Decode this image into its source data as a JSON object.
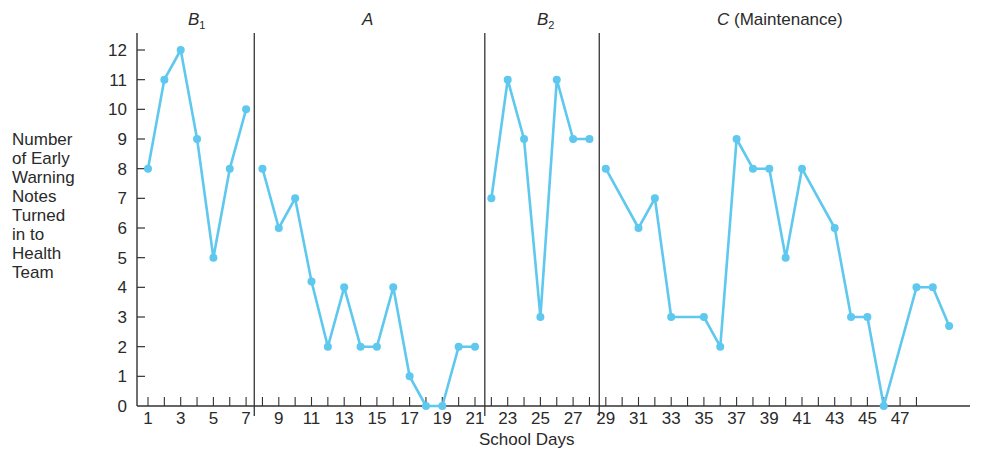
{
  "chart_data": {
    "type": "line",
    "title": "",
    "xlabel": "School Days",
    "ylabel": "Number of Early Warning Notes Turned in to Health Team",
    "ylabel_lines": [
      "Number",
      "of Early",
      "Warning",
      "Notes",
      "Turned",
      "in to",
      "Health",
      "Team"
    ],
    "ylim": [
      0,
      12
    ],
    "yticks": [
      0,
      1,
      2,
      3,
      4,
      5,
      6,
      7,
      8,
      9,
      10,
      11,
      12
    ],
    "xtick_labels": [
      1,
      3,
      5,
      7,
      9,
      11,
      13,
      15,
      17,
      19,
      21,
      23,
      25,
      27,
      29,
      31,
      33,
      35,
      37,
      39,
      41,
      43,
      45,
      47
    ],
    "x_minor_ticks_to": 48,
    "grid": false,
    "line_color": "#5ec8ee",
    "axis_color": "#333333",
    "phases": [
      {
        "name": "B",
        "sub": "1",
        "suffix": "",
        "start_day": 1,
        "end_day": 7,
        "x": [
          1,
          2,
          3,
          4,
          5,
          6,
          7
        ],
        "values": [
          8,
          11,
          12,
          9,
          5,
          8,
          10
        ]
      },
      {
        "name": "A",
        "sub": "",
        "suffix": "",
        "start_day": 8,
        "end_day": 21,
        "x": [
          8,
          9,
          10,
          11,
          12,
          13,
          14,
          15,
          16,
          17,
          18,
          19,
          20,
          21
        ],
        "values": [
          8,
          6,
          7,
          4.2,
          2,
          4,
          2,
          2,
          4,
          1,
          0,
          0,
          2,
          2
        ]
      },
      {
        "name": "B",
        "sub": "2",
        "suffix": "",
        "start_day": 22,
        "end_day": 28,
        "x": [
          22,
          23,
          24,
          25,
          26,
          27,
          28
        ],
        "values": [
          7,
          11,
          9,
          3,
          11,
          9,
          9
        ]
      },
      {
        "name": "C",
        "sub": "",
        "suffix": " (Maintenance)",
        "start_day": 29,
        "end_day": 50,
        "x": [
          29,
          31,
          32,
          33,
          35,
          36,
          37,
          38,
          39,
          40,
          41,
          43,
          44,
          45,
          46,
          48,
          49,
          50
        ],
        "values": [
          8,
          6,
          7,
          3,
          3,
          2,
          9,
          8,
          8,
          5,
          8,
          6,
          3,
          3,
          0,
          4,
          4,
          2.7
        ]
      }
    ],
    "phase_dividers_after_day": [
      7.5,
      21.6,
      28.6
    ]
  }
}
